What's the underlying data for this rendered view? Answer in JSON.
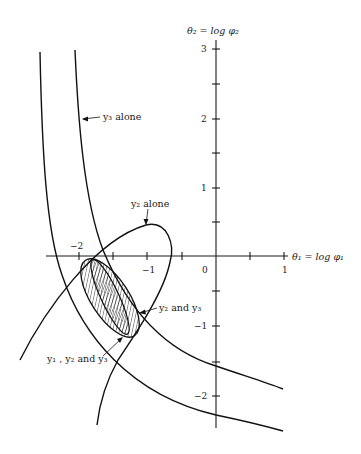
{
  "figure": {
    "x_axis": {
      "label": "θ₁ = log φ₁",
      "ticks": [
        {
          "value": -2,
          "label": "−2"
        },
        {
          "value": -1.5,
          "label": ""
        },
        {
          "value": -1,
          "label": "−1"
        },
        {
          "value": -0.5,
          "label": ""
        },
        {
          "value": 0,
          "label": "0"
        },
        {
          "value": 0.5,
          "label": ""
        },
        {
          "value": 1,
          "label": "1"
        }
      ]
    },
    "y_axis": {
      "label": "θ₂ = log φ₂",
      "ticks": [
        {
          "value": 3,
          "label": "3"
        },
        {
          "value": 2.5,
          "label": ""
        },
        {
          "value": 2,
          "label": "2"
        },
        {
          "value": 1.5,
          "label": ""
        },
        {
          "value": 1,
          "label": "1"
        },
        {
          "value": 0.5,
          "label": ""
        },
        {
          "value": -0.5,
          "label": ""
        },
        {
          "value": -1,
          "label": "−1"
        },
        {
          "value": -1.5,
          "label": ""
        },
        {
          "value": -2,
          "label": "−2"
        }
      ]
    },
    "labels": {
      "y3_alone": "y₃ alone",
      "y2_alone": "y₂ alone",
      "y2_and_y3": "y₂ and y₃",
      "y1_y2_y3": "y₁ , y₂ and y₃"
    },
    "regions": [
      {
        "name": "y3 alone",
        "shape": "curved band"
      },
      {
        "name": "y2 alone",
        "shape": "open tear-drop contour"
      },
      {
        "name": "y2 and y3",
        "shape": "hatched ellipse"
      },
      {
        "name": "y1, y2 and y3",
        "shape": "narrow hatched ellipse"
      }
    ],
    "colors": {
      "ink": "#111111",
      "background": "#ffffff"
    }
  }
}
